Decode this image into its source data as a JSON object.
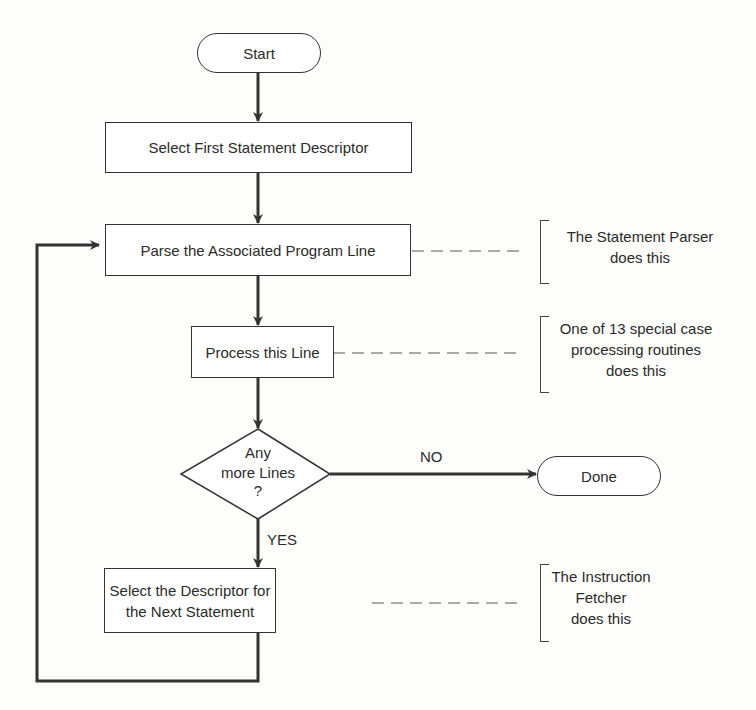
{
  "diagram": {
    "type": "flowchart",
    "nodes": {
      "start": {
        "label": "Start",
        "shape": "terminal"
      },
      "select_first": {
        "label": "Select First Statement Descriptor",
        "shape": "process"
      },
      "parse": {
        "label": "Parse the Associated Program Line",
        "shape": "process"
      },
      "process": {
        "label": "Process this Line",
        "shape": "process"
      },
      "decision": {
        "line1": "Any",
        "line2": "more Lines",
        "line3": "?",
        "shape": "decision"
      },
      "done": {
        "label": "Done",
        "shape": "terminal"
      },
      "select_next": {
        "line1": "Select the Descriptor for",
        "line2": "the Next Statement",
        "shape": "process"
      }
    },
    "edges": {
      "no_label": "NO",
      "yes_label": "YES"
    },
    "annotations": {
      "parser": {
        "line1": "The Statement Parser",
        "line2": "does this"
      },
      "special": {
        "line1": "One of 13 special case",
        "line2": "processing routines",
        "line3": "does this"
      },
      "fetcher": {
        "line1": "The Instruction",
        "line2": "Fetcher",
        "line3": "does this"
      }
    },
    "colors": {
      "stroke": "#333333",
      "background": "#fdfdfc"
    }
  }
}
